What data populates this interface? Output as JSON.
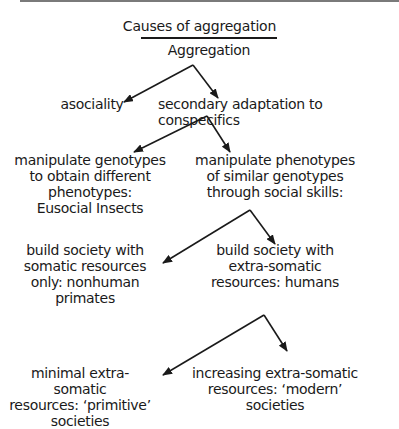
{
  "figure": {
    "title": "Causes of aggregation",
    "root": "Aggregation",
    "level1": {
      "left": "asociality",
      "right": "secondary adaptation to conspecifics"
    },
    "level2": {
      "left": "manipulate genotypes\nto obtain different\nphenotypes:\nEusocial Insects",
      "right": "manipulate phenotypes\nof similar genotypes\nthrough social skills:"
    },
    "level3": {
      "left": "build society with\nsomatic resources\nonly: nonhuman\nprimates",
      "right": "build society with\nextra-somatic\nresources: humans"
    },
    "level4": {
      "left": "minimal extra-somatic\nresources: ‘primitive’\nsocieties",
      "right": "increasing extra-somatic\nresources: ‘modern’\nsocieties"
    },
    "line_color": "#1a1a1a"
  }
}
